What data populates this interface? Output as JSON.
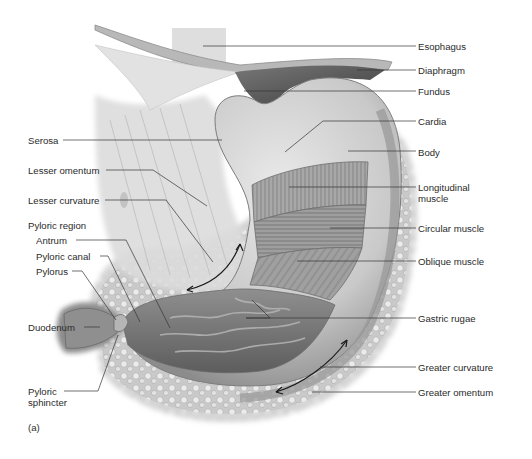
{
  "figure": {
    "panel_label": "(a)",
    "colors": {
      "background": "#ffffff",
      "tissue_light": "#e6e6e6",
      "tissue_mid": "#a9a9a9",
      "tissue_dark": "#555555",
      "leader_line": "#333333",
      "label_text": "#2b2b2b"
    }
  },
  "labels_right": [
    {
      "text": "Esophagus"
    },
    {
      "text": "Diaphragm"
    },
    {
      "text": "Fundus"
    },
    {
      "text": "Cardia"
    },
    {
      "text": "Body"
    },
    {
      "text": "Longitudinal muscle",
      "line1": "Longitudinal",
      "line2": "muscle"
    },
    {
      "text": "Circular muscle"
    },
    {
      "text": "Oblique muscle"
    },
    {
      "text": "Gastric rugae"
    },
    {
      "text": "Greater curvature"
    },
    {
      "text": "Greater omentum"
    }
  ],
  "labels_left": [
    {
      "text": "Serosa"
    },
    {
      "text": "Lesser omentum"
    },
    {
      "text": "Lesser curvature"
    },
    {
      "text": "Pyloric region"
    },
    {
      "text": "Antrum"
    },
    {
      "text": "Pyloric canal"
    },
    {
      "text": "Pylorus"
    },
    {
      "text": "Duodenum"
    },
    {
      "text": "Pyloric sphincter",
      "line1": "Pyloric",
      "line2": "sphincter"
    }
  ]
}
